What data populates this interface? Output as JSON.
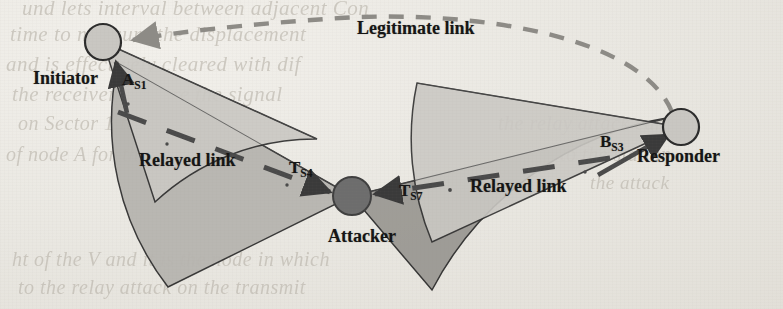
{
  "figure": {
    "kind": "relay-attack-directional-antenna-diagram",
    "background_color": "#e8e6e1"
  },
  "nodes": [
    {
      "id": "initiator",
      "label": "Initiator",
      "cx": 103,
      "cy": 42,
      "r": 18,
      "fill": "#c9c7c2",
      "stroke": "#2b2b2b"
    },
    {
      "id": "attacker",
      "label": "Attacker",
      "cx": 352,
      "cy": 196,
      "r": 19,
      "fill": "#6d6d6d",
      "stroke": "#3a3a3a"
    },
    {
      "id": "responder",
      "label": "Responder",
      "cx": 681,
      "cy": 127,
      "r": 18,
      "fill": "#c9c7c2",
      "stroke": "#2b2b2b"
    }
  ],
  "node_labels": {
    "initiator": "Initiator",
    "attacker": "Attacker",
    "responder": "Responder"
  },
  "beams": [
    {
      "id": "beam-initiator",
      "owner": "initiator",
      "shade": "light",
      "fill": "#c6c4bf"
    },
    {
      "id": "beam-attacker-left",
      "owner": "attacker",
      "shade": "mid",
      "fill": "#b4b2ad"
    },
    {
      "id": "beam-attacker-right",
      "owner": "attacker",
      "shade": "dark",
      "fill": "#9a9893"
    },
    {
      "id": "beam-responder",
      "owner": "responder",
      "shade": "light",
      "fill": "#c6c4bf"
    }
  ],
  "links": [
    {
      "id": "legitimate-link",
      "label": "Legitimate link",
      "style": "dashed",
      "from": "responder",
      "to": "initiator",
      "color": "#8d8b86"
    },
    {
      "id": "relayed-link-left",
      "label": "Relayed link",
      "style": "solid-arrow",
      "from": "initiator",
      "to": "attacker",
      "color": "#3a3a3a"
    },
    {
      "id": "relayed-link-right",
      "label": "Relayed link",
      "style": "solid-arrow",
      "from": "responder",
      "to": "attacker",
      "color": "#3a3a3a"
    }
  ],
  "beam_labels": [
    {
      "id": "as1",
      "text": "A",
      "sub": "S1",
      "x": 122,
      "y": 72
    },
    {
      "id": "ts4",
      "text": "T",
      "sub": "S4",
      "x": 289,
      "y": 160
    },
    {
      "id": "ts7",
      "text": "T",
      "sub": "S7",
      "x": 399,
      "y": 183
    },
    {
      "id": "bs3",
      "text": "B",
      "sub": "S3",
      "x": 600,
      "y": 134
    }
  ],
  "link_labels": {
    "legitimate": "Legitimate link",
    "relayed_left": "Relayed link",
    "relayed_right": "Relayed link"
  },
  "ghost_text": [
    {
      "text": "und lets interval between adjacent Con",
      "x": 22,
      "y": -4,
      "size": 21
    },
    {
      "text": "time to measure the displacement",
      "x": 10,
      "y": 22,
      "size": 21
    },
    {
      "text": "and is effectively cleared with dif",
      "x": 6,
      "y": 52,
      "size": 21
    },
    {
      "text": "the receiver capture the signal",
      "x": 12,
      "y": 82,
      "size": 21
    },
    {
      "text": "on Sector 1 to 8 for the",
      "x": 18,
      "y": 112,
      "size": 20
    },
    {
      "text": "of node A for the in",
      "x": 6,
      "y": 143,
      "size": 20
    },
    {
      "text": "the relay attack can",
      "x": 498,
      "y": 112,
      "size": 20
    },
    {
      "text": "to the station",
      "x": 560,
      "y": 143,
      "size": 20
    },
    {
      "text": "the attack",
      "x": 590,
      "y": 172,
      "size": 19
    },
    {
      "text": "ht of the V and it is the node in which",
      "x": 12,
      "y": 248,
      "size": 20
    },
    {
      "text": "to the relay attack on the transmit",
      "x": 18,
      "y": 276,
      "size": 20
    }
  ]
}
